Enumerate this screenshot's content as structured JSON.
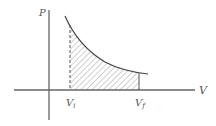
{
  "diagram": {
    "type": "pv-diagram",
    "title": "",
    "axes": {
      "y_label": "P",
      "x_label": "V"
    },
    "markers": {
      "initial_volume": "V",
      "initial_sub": "i",
      "final_volume": "V",
      "final_sub": "f"
    },
    "shaded_region": "work done under curve from Vi to Vf",
    "colors": {
      "line": "#555555",
      "hatch": "#777777",
      "background": "#ffffff"
    }
  }
}
